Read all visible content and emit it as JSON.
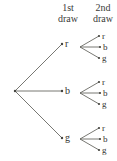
{
  "figure": {
    "type": "probability-tree-diagram",
    "background_color": "#ffffff",
    "line_color": "#55554f",
    "text_color": "#33332f"
  },
  "headers": {
    "first": {
      "line1": "1st",
      "line2": "draw"
    },
    "second": {
      "line1": "2nd",
      "line2": "draw"
    }
  },
  "tree": {
    "root": {
      "x": 15,
      "y": 91
    },
    "first_draw": [
      {
        "label": "r",
        "node_x": 62,
        "node_y": 44,
        "label_x": 65,
        "label_y": 39,
        "fan_x": 80,
        "fan_y": 47,
        "children": [
          {
            "label": "r",
            "tip_x": 99,
            "tip_y": 36,
            "label_x": 102,
            "label_y": 31
          },
          {
            "label": "b",
            "tip_x": 100,
            "tip_y": 47,
            "label_x": 103,
            "label_y": 42
          },
          {
            "label": "g",
            "tip_x": 99,
            "tip_y": 58,
            "label_x": 102,
            "label_y": 53
          }
        ]
      },
      {
        "label": "b",
        "node_x": 62,
        "node_y": 91,
        "label_x": 65,
        "label_y": 86,
        "fan_x": 80,
        "fan_y": 93,
        "children": [
          {
            "label": "r",
            "tip_x": 99,
            "tip_y": 82,
            "label_x": 102,
            "label_y": 77
          },
          {
            "label": "b",
            "tip_x": 100,
            "tip_y": 93,
            "label_x": 103,
            "label_y": 88
          },
          {
            "label": "g",
            "tip_x": 99,
            "tip_y": 104,
            "label_x": 102,
            "label_y": 99
          }
        ]
      },
      {
        "label": "g",
        "node_x": 62,
        "node_y": 138,
        "label_x": 65,
        "label_y": 133,
        "fan_x": 80,
        "fan_y": 139,
        "children": [
          {
            "label": "r",
            "tip_x": 99,
            "tip_y": 128,
            "label_x": 102,
            "label_y": 123
          },
          {
            "label": "b",
            "tip_x": 100,
            "tip_y": 139,
            "label_x": 103,
            "label_y": 134
          },
          {
            "label": "g",
            "tip_x": 99,
            "tip_y": 150,
            "label_x": 102,
            "label_y": 145
          }
        ]
      }
    ]
  },
  "chart_data": {
    "type": "diagram",
    "title": "",
    "columns": [
      "1st draw",
      "2nd draw"
    ],
    "outcomes": [
      "rr",
      "rb",
      "rg",
      "br",
      "bb",
      "bg",
      "gr",
      "gb",
      "gg"
    ],
    "first_draw_values": [
      "r",
      "b",
      "g"
    ],
    "second_draw_values": [
      "r",
      "b",
      "g"
    ]
  }
}
